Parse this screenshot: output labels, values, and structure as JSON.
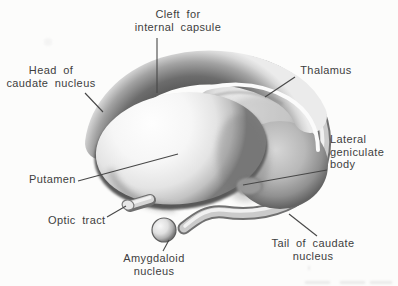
{
  "canvas": {
    "width": 398,
    "height": 286,
    "background": "#fcfcfb"
  },
  "palette": {
    "ink": "#3e3e3e",
    "leader_line": "#474747",
    "shade_dark": "#5a5a5a",
    "shade_mid": "#b5b5b5",
    "shade_light": "#f2f2f2",
    "highlight": "#fbfbfb"
  },
  "labels": [
    {
      "id": "cleft-for-internal-capsule",
      "text": "Cleft for\ninternal capsule",
      "align": "center",
      "x": 178,
      "y": 8,
      "leader": [
        157,
        38,
        157,
        93
      ]
    },
    {
      "id": "head-of-caudate-nucleus",
      "text": "Head of\ncaudate nucleus",
      "align": "center",
      "x": 51,
      "y": 64,
      "leader": [
        85,
        93,
        103,
        112
      ]
    },
    {
      "id": "thalamus",
      "text": "Thalamus",
      "align": "center",
      "x": 326,
      "y": 64,
      "leader": [
        295,
        77,
        265,
        97
      ]
    },
    {
      "id": "lateral-geniculate-body",
      "text": "Lateral\ngeniculate\nbody",
      "align": "left",
      "x": 330,
      "y": 133,
      "leader": [
        327,
        170,
        243,
        185
      ]
    },
    {
      "id": "putamen",
      "text": "Putamen",
      "align": "left",
      "x": 29,
      "y": 173,
      "leader": [
        78,
        181,
        178,
        154
      ]
    },
    {
      "id": "optic-tract",
      "text": "Optic tract",
      "align": "left",
      "x": 48,
      "y": 214,
      "leader": [
        107,
        217,
        126,
        206
      ]
    },
    {
      "id": "amygdaloid-nucleus",
      "text": "Amygdaloid\nnucleus",
      "align": "center",
      "x": 154,
      "y": 252,
      "leader": [
        163,
        251,
        169,
        240
      ]
    },
    {
      "id": "tail-of-caudate-nucleus",
      "text": "Tail of caudate\nnucleus",
      "align": "center",
      "x": 313,
      "y": 237,
      "leader": [
        317,
        236,
        289,
        214
      ]
    }
  ]
}
